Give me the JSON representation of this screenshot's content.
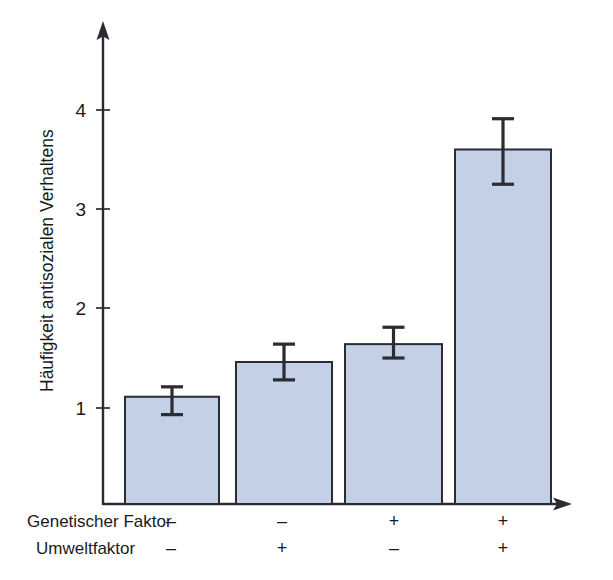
{
  "chart_data": {
    "type": "bar",
    "title": "",
    "subtitle": "",
    "xlabel": "",
    "ylabel": "Häufigkeit antisozialen Verhaltens",
    "ylim": [
      0,
      4.55
    ],
    "yticks": [
      1,
      2,
      3,
      4
    ],
    "ytick_labels": [
      "1",
      "2",
      "3",
      "4"
    ],
    "grid": false,
    "legend": null,
    "language": "de",
    "categories": [
      "1",
      "2",
      "3",
      "4"
    ],
    "values": [
      1.08,
      1.43,
      1.61,
      3.57
    ],
    "errors_low": [
      0.9,
      1.25,
      1.47,
      3.22
    ],
    "errors_high": [
      1.18,
      1.61,
      1.78,
      3.88
    ],
    "bar_color": "#c4d0e5",
    "bar_edge_color": "#2b2b33",
    "axis_color": "#2b2b33",
    "error_bar_color": "#2b2b33",
    "group_rows": [
      {
        "label": "Genetischer Faktor",
        "signs": [
          "–",
          "–",
          "+",
          "+"
        ]
      },
      {
        "label": "Umweltfaktor",
        "signs": [
          "–",
          "+",
          "–",
          "+"
        ]
      }
    ]
  },
  "axes": {
    "y_axis_name": "y-axis",
    "x_axis_name": "x-axis"
  }
}
